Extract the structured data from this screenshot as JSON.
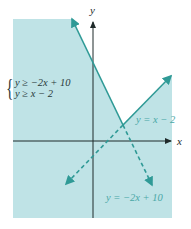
{
  "figure": {
    "axes": {
      "x_label": "x",
      "y_label": "y"
    },
    "system": {
      "inequalities": [
        "y ≥ −2x + 10",
        "y ≥ x − 2"
      ]
    },
    "line_labels": {
      "line1": "y = x − 2",
      "line2": "y = −2x + 10"
    },
    "colors": {
      "shade": "#bfe3e6",
      "line": "#2f9a96",
      "axis": "#1f2a2a",
      "label": "#4aa8a6"
    },
    "intersection": {
      "x": 4,
      "y": 2
    }
  }
}
